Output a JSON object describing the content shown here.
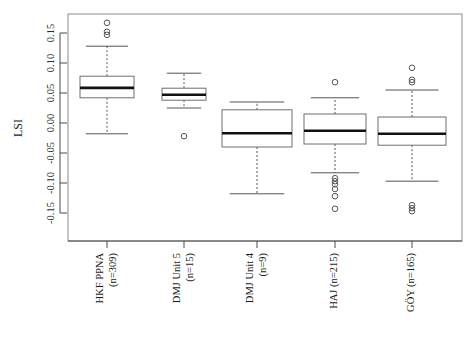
{
  "chart_data": {
    "type": "box",
    "title": "",
    "xlabel": "",
    "ylabel": "LSI",
    "ylim": [
      -0.17,
      0.18
    ],
    "grid": false,
    "legend": null,
    "y_ticks": [
      0.15,
      0.1,
      0.05,
      0.0,
      -0.05,
      -0.1,
      -0.15
    ],
    "y_tick_labels": [
      "0.15",
      "0.10",
      "0.05",
      "0.00",
      "-0.05",
      "-0.10",
      "-0.15"
    ],
    "categories": [
      "HKF PPNA\n(n=309)",
      "DMJ Unit 5\n(n=15)",
      "DMJ Unit 4\n(n=9)",
      "HAJ (n=215)",
      "GÖY (n=165)"
    ],
    "category_lines": [
      [
        "HKF PPNA",
        "(n=309)"
      ],
      [
        "DMJ Unit 5",
        "(n=15)"
      ],
      [
        "DMJ Unit 4",
        "(n=9)"
      ],
      [
        "HAJ (n=215)"
      ],
      [
        "GÖY (n=165)"
      ]
    ],
    "counts": [
      309,
      15,
      9,
      215,
      165
    ],
    "boxes": [
      {
        "label": "HKF PPNA (n=309)",
        "whisker_low": -0.018,
        "q1": 0.042,
        "median": 0.0585,
        "q3": 0.078,
        "whisker_high": 0.128,
        "outliers": [
          0.167,
          0.152,
          0.147
        ]
      },
      {
        "label": "DMJ Unit 5 (n=15)",
        "whisker_low": 0.025,
        "q1": 0.038,
        "median": 0.047,
        "q3": 0.058,
        "whisker_high": 0.083,
        "outliers": [
          -0.022
        ]
      },
      {
        "label": "DMJ Unit 4 (n=9)",
        "whisker_low": -0.118,
        "q1": -0.04,
        "median": -0.017,
        "q3": 0.022,
        "whisker_high": 0.035,
        "outliers": []
      },
      {
        "label": "HAJ (n=215)",
        "whisker_low": -0.083,
        "q1": -0.035,
        "median": -0.013,
        "q3": 0.015,
        "whisker_high": 0.042,
        "outliers": [
          0.068,
          -0.092,
          -0.097,
          -0.102,
          -0.11,
          -0.122,
          -0.143
        ]
      },
      {
        "label": "GÖY (n=165)",
        "whisker_low": -0.097,
        "q1": -0.037,
        "median": -0.018,
        "q3": 0.01,
        "whisker_high": 0.055,
        "outliers": [
          0.092,
          0.072,
          0.068,
          -0.137,
          -0.142,
          -0.147
        ]
      }
    ]
  },
  "colors": {
    "frame": "#8a8a8a",
    "axis": "#4a4a4a",
    "box_stroke": "#6e6e6e",
    "median": "#111111",
    "whisker": "#555555",
    "background": "#ffffff"
  }
}
